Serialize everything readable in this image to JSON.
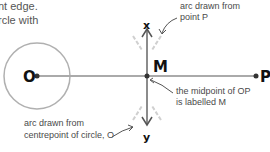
{
  "intro_text": {
    "line1": "nt edge.",
    "line2": "rcle with"
  },
  "points": {
    "O": "O",
    "P": "P",
    "M": "M",
    "x": "x",
    "y": "y"
  },
  "annotations": {
    "arc_from_P": {
      "line1": "arc drawn from",
      "line2": "point P"
    },
    "arc_from_O": {
      "line1": "arc drawn from",
      "line2": "centrepoint of circle, O"
    },
    "midpoint": {
      "line1": "the midpoint of OP",
      "line2": "is labelled M"
    }
  },
  "colors": {
    "line": "#aaaaaa",
    "circle": "#b0b0b0",
    "arc": "#d0d0d0",
    "axis": "#666666",
    "dot": "#333333",
    "text": "#4a4a4a"
  }
}
